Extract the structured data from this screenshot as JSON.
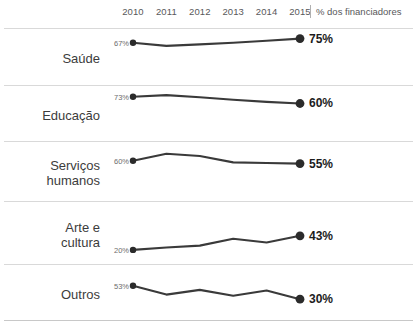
{
  "header": {
    "years": [
      "2010",
      "2011",
      "2012",
      "2013",
      "2014",
      "2015"
    ],
    "note": "% dos financiadores",
    "divider": "|"
  },
  "chart_data": {
    "type": "line",
    "title": "",
    "subtitle": "",
    "xlabel": "",
    "ylabel": "% dos financiadores",
    "categories": [
      "2010",
      "2011",
      "2012",
      "2013",
      "2014",
      "2015"
    ],
    "ylim": [
      15,
      80
    ],
    "grid": false,
    "legend": "none",
    "layout": "small-multiples-sparklines",
    "series": [
      {
        "name": "Saúde",
        "values": [
          67,
          61,
          64,
          67,
          71,
          75
        ],
        "start_label": "67%",
        "end_label": "75%"
      },
      {
        "name": "Educação",
        "values": [
          73,
          76,
          72,
          67,
          63,
          60
        ],
        "start_label": "73%",
        "end_label": "60%"
      },
      {
        "name": "Serviços humanos",
        "values": [
          60,
          72,
          68,
          57,
          56,
          55
        ],
        "start_label": "60%",
        "end_label": "55%"
      },
      {
        "name": "Arte e cultura",
        "values": [
          20,
          24,
          27,
          38,
          32,
          43
        ],
        "start_label": "20%",
        "end_label": "43%"
      },
      {
        "name": "Outros",
        "values": [
          53,
          38,
          46,
          36,
          45,
          30
        ],
        "start_label": "53%",
        "end_label": "30%"
      }
    ],
    "colors": {
      "line": "#3a3a3a",
      "dot": "#2b2b2b",
      "rule": "#d9d9d9",
      "start_text": "#6d6d6d",
      "end_text": "#1c1c1c"
    }
  },
  "rows": [
    {
      "label_lines": [
        "Saúde"
      ]
    },
    {
      "label_lines": [
        "Educação"
      ]
    },
    {
      "label_lines": [
        "Serviços",
        "humanos"
      ]
    },
    {
      "label_lines": [
        "Arte e",
        "cultura"
      ]
    },
    {
      "label_lines": [
        "Outros"
      ]
    }
  ]
}
